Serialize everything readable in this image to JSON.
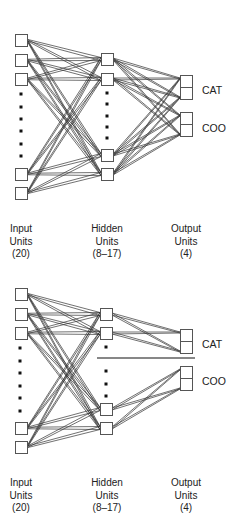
{
  "diagrams": [
    {
      "id": "fully-connected",
      "input_units": {
        "x": 15,
        "boxes_y": [
          34,
          54,
          73,
          168,
          187
        ],
        "dots_y": [
          94,
          107,
          119,
          131,
          144,
          156
        ],
        "dots_x": 21
      },
      "hidden_units": {
        "x": 101,
        "boxes_y": [
          53,
          73,
          149,
          168
        ],
        "dots_y": [
          93,
          104,
          116,
          127,
          138
        ],
        "dots_x": 107
      },
      "output_units": {
        "x": 180,
        "boxes_y": [
          75,
          87,
          112,
          124
        ]
      },
      "output_labels": [
        {
          "text": "CAT",
          "y": 90
        },
        {
          "text": "COO",
          "y": 128
        }
      ],
      "separator": null,
      "column_labels": {
        "y": 228,
        "input": [
          "Input",
          "Units",
          "(20)"
        ],
        "hidden": [
          "Hidden",
          "Units",
          "(8–17)"
        ],
        "output": [
          "Output",
          "Units",
          "(4)"
        ]
      }
    },
    {
      "id": "split-hidden",
      "input_units": {
        "x": 15,
        "boxes_y": [
          288,
          308,
          327,
          422,
          441
        ],
        "dots_y": [
          348,
          361,
          373,
          386,
          398,
          411
        ],
        "dots_x": 20
      },
      "hidden_units": {
        "x": 100,
        "boxes_y": [
          308,
          327,
          403,
          422
        ],
        "dots_y": [
          347,
          371,
          384,
          396
        ],
        "dots_x": 106
      },
      "output_units": {
        "x": 180,
        "boxes_y": [
          329,
          341,
          366,
          378
        ]
      },
      "output_labels": [
        {
          "text": "CAT",
          "y": 344
        },
        {
          "text": "COO",
          "y": 381
        }
      ],
      "separator": {
        "x1": 97,
        "x2": 195,
        "y": 358
      },
      "column_labels": {
        "y": 482,
        "input": [
          "Input",
          "Units",
          "(20)"
        ],
        "hidden": [
          "Hidden",
          "Units",
          "(8–17)"
        ],
        "output": [
          "Output",
          "Units",
          "(4)"
        ]
      }
    }
  ],
  "colors": {
    "line": "#333333",
    "box_stroke": "#555555",
    "box_fill": "#ffffff",
    "text": "#222222"
  }
}
